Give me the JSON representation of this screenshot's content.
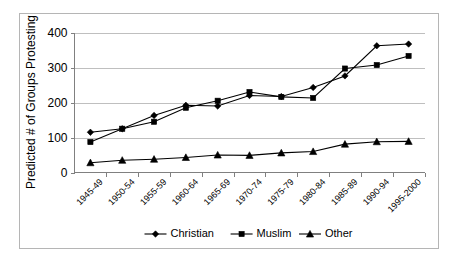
{
  "chart_data": {
    "type": "line",
    "title": "",
    "xlabel": "",
    "ylabel": "Predicted # of Groups Protesting",
    "ylim": [
      0,
      400
    ],
    "yticks": [
      0,
      100,
      200,
      300,
      400
    ],
    "grid": true,
    "legend_position": "bottom",
    "categories": [
      "1945-49",
      "1950-54",
      "1955-59",
      "1960-64",
      "1965-69",
      "1970-74",
      "1975-79",
      "1980-84",
      "1985-89",
      "1990-94",
      "1995-2000"
    ],
    "series": [
      {
        "name": "Christian",
        "marker": "diamond",
        "color": "#000000",
        "values": [
          115,
          125,
          163,
          192,
          190,
          220,
          217,
          243,
          276,
          362,
          367
        ]
      },
      {
        "name": "Muslim",
        "marker": "square",
        "color": "#000000",
        "values": [
          87,
          125,
          145,
          185,
          205,
          230,
          216,
          213,
          297,
          307,
          333
        ]
      },
      {
        "name": "Other",
        "marker": "triangle",
        "color": "#000000",
        "values": [
          28,
          35,
          38,
          43,
          50,
          49,
          56,
          60,
          81,
          88,
          89
        ]
      }
    ]
  },
  "axes": {
    "y_title": "Predicted # of Groups Protesting",
    "y_tick_labels": [
      "0",
      "100",
      "200",
      "300",
      "400"
    ],
    "x_tick_labels": [
      "1945-49",
      "1950-54",
      "1955-59",
      "1960-64",
      "1965-69",
      "1970-74",
      "1975-79",
      "1980-84",
      "1985-89",
      "1990-94",
      "1995-2000"
    ]
  },
  "legend": {
    "items": [
      {
        "label": "Christian",
        "marker": "diamond-marker"
      },
      {
        "label": "Muslim",
        "marker": "square-marker"
      },
      {
        "label": "Other",
        "marker": "triangle-marker"
      }
    ]
  },
  "colors": {
    "series": "#000000",
    "gridline": "#bfbfbf",
    "axis": "#808080",
    "frame": "#b5b5b5",
    "background": "#ffffff"
  }
}
